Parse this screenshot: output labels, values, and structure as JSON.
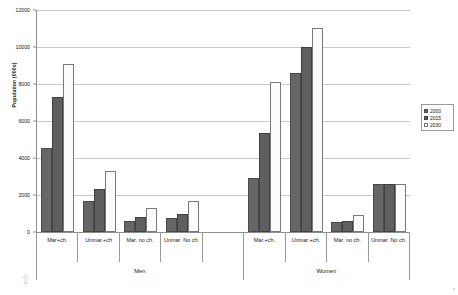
{
  "chart_data": {
    "type": "bar",
    "title": "",
    "xlabel": "",
    "ylabel": "Population (000s)",
    "ylim": [
      0,
      12000
    ],
    "ytick_values": [
      12000,
      10000,
      8000,
      6000,
      4000,
      2000,
      0
    ],
    "ytick_labels": [
      "12000",
      "10000",
      "8000",
      "6000",
      "4000",
      "2000",
      "0"
    ],
    "grid": true,
    "legend_position": "right",
    "categories": [
      "Mar+ch.",
      "Unmar.+ch",
      "Mar. no ch.",
      "Unmar. No ch.",
      "",
      "Mar.+ch.",
      "Unmar.+ch.",
      "Mar. no ch.",
      "Unmar. No ch."
    ],
    "groups": [
      {
        "label": "Men",
        "span": 5
      },
      {
        "label": "Women",
        "span": 4
      }
    ],
    "series": [
      {
        "name": "2000",
        "color": "#666666",
        "values": [
          4550,
          1680,
          600,
          770,
          null,
          2900,
          8600,
          530,
          2600
        ]
      },
      {
        "name": "2015",
        "color": "#5f5f5f",
        "values": [
          7320,
          2330,
          830,
          1000,
          null,
          5350,
          10000,
          620,
          2600
        ]
      },
      {
        "name": "2030",
        "color": "#fbfbfb",
        "values": [
          9100,
          3320,
          1280,
          1670,
          null,
          8100,
          11050,
          900,
          2600
        ]
      }
    ]
  },
  "legend": {
    "entries": [
      "2000",
      "2015",
      "2030"
    ]
  },
  "chrome": {
    "scroll_up_icon": "scroll-up-arrow"
  }
}
